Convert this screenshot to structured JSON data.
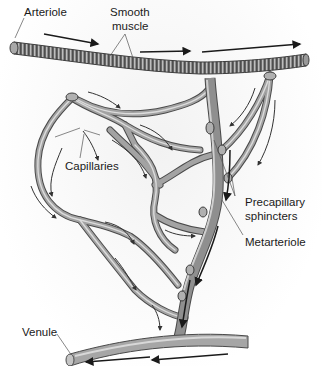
{
  "diagram": {
    "labels": {
      "arteriole": "Arteriole",
      "smooth_muscle_line1": "Smooth",
      "smooth_muscle_line2": "muscle",
      "capillaries": "Capillaries",
      "precapillary_line1": "Precapillary",
      "precapillary_line2": "sphincters",
      "metarteriole": "Metarteriole",
      "venule": "Venule"
    },
    "colors": {
      "vessel_fill": "#9a9a9a",
      "vessel_highlight": "#d4d4d4",
      "vessel_outline": "#4a4a4a",
      "arrow": "#1a1a1a",
      "leader_line": "#555555",
      "label_text": "#1a1a1a"
    }
  }
}
